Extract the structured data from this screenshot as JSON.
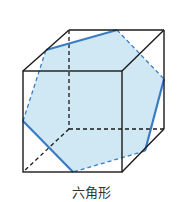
{
  "figure": {
    "caption": "六角形",
    "colors": {
      "edge": "#1a1a1a",
      "section_fill": "#cfe8f3",
      "section_edge": "#3a7cc4"
    },
    "cube": {
      "vertices": {
        "A_front_top_left": [
          23,
          71
        ],
        "B_front_top_right": [
          122,
          71
        ],
        "C_front_bottom_right": [
          122,
          172
        ],
        "D_front_bottom_left": [
          23,
          172
        ],
        "E_back_top_left": [
          69,
          30
        ],
        "F_back_top_right": [
          164,
          30
        ],
        "G_back_bottom_right": [
          164,
          129
        ],
        "H_back_bottom_left": [
          69,
          129
        ]
      }
    },
    "hexagon_cross_section": {
      "label": "六角形",
      "points": [
        [
          117,
          30
        ],
        [
          164,
          79
        ],
        [
          145,
          151
        ],
        [
          73,
          172
        ],
        [
          23,
          121
        ],
        [
          46,
          50
        ]
      ]
    }
  }
}
